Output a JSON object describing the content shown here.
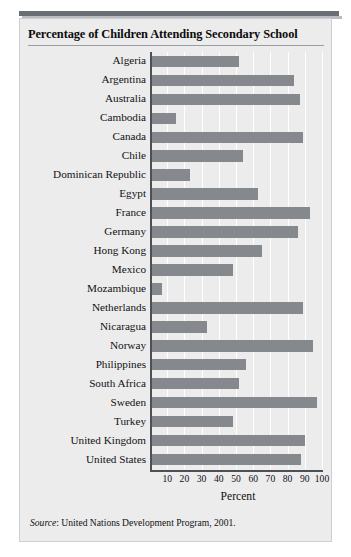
{
  "chart_data": {
    "type": "bar",
    "orientation": "horizontal",
    "title": "Percentage of Children Attending Secondary School",
    "xlabel": "Percent",
    "ylabel": "",
    "xlim": [
      0,
      100
    ],
    "xticks": [
      10,
      20,
      30,
      40,
      50,
      60,
      70,
      80,
      90,
      100
    ],
    "grid": true,
    "legend": false,
    "bar_color": "#85888d",
    "categories": [
      "Algeria",
      "Argentina",
      "Australia",
      "Cambodia",
      "Canada",
      "Chile",
      "Dominican Republic",
      "Egypt",
      "France",
      "Germany",
      "Hong Kong",
      "Mexico",
      "Mozambique",
      "Netherlands",
      "Nicaragua",
      "Norway",
      "Philippines",
      "South Africa",
      "Sweden",
      "Turkey",
      "United Kingdom",
      "United States"
    ],
    "values": [
      52,
      84,
      87,
      15,
      89,
      54,
      23,
      63,
      93,
      86,
      65,
      48,
      7,
      89,
      33,
      95,
      56,
      52,
      97,
      48,
      90,
      88
    ],
    "source": {
      "label": "Source",
      "text": ": United Nations Development Program, 2001."
    }
  },
  "panel": {
    "background": "#ececed",
    "border_color": "#cfcfd1",
    "accent_rule": "#6b6f75"
  }
}
